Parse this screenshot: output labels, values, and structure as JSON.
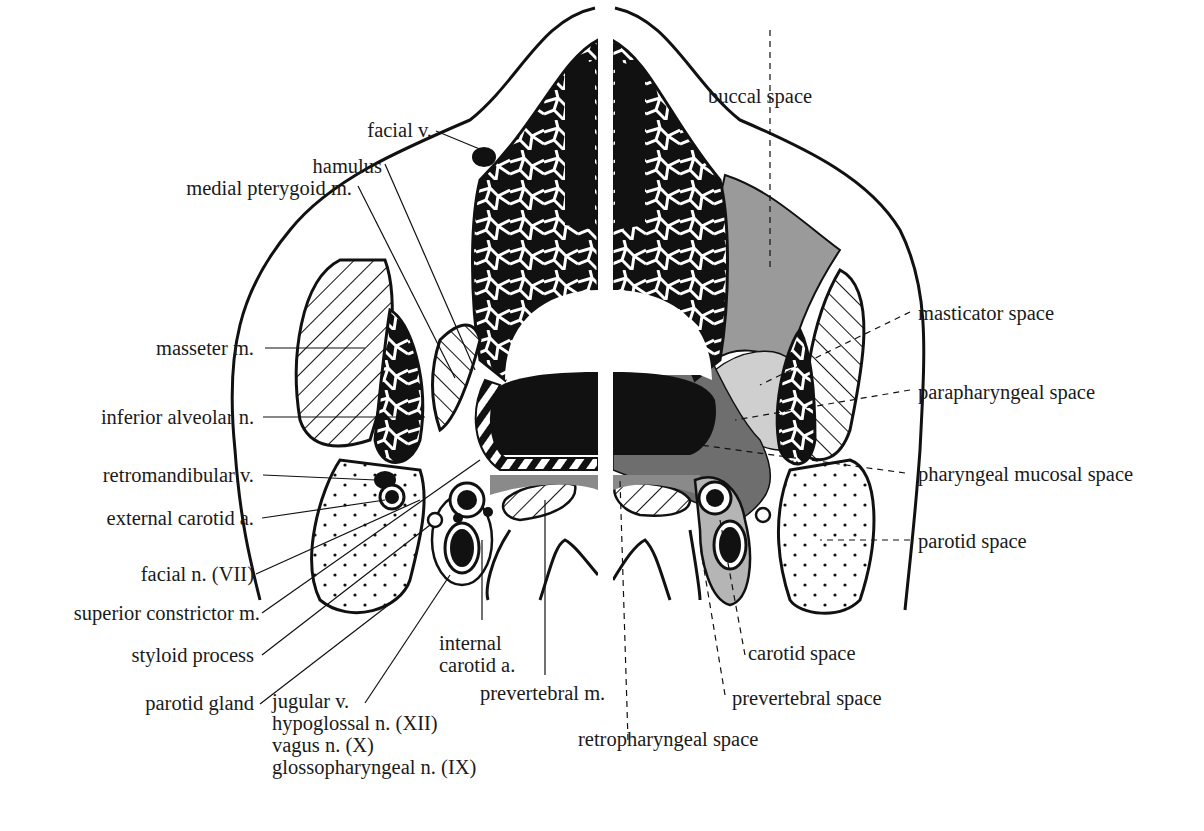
{
  "figure": {
    "type": "anatomical cross-section diagram (axial, suprahyoid neck)",
    "left_half_labels": [
      {
        "id": "facial-v",
        "text": "facial v."
      },
      {
        "id": "hamulus",
        "text": "hamulus"
      },
      {
        "id": "medial-pterygoid",
        "text": "medial pterygoid m."
      },
      {
        "id": "masseter",
        "text": "masseter m."
      },
      {
        "id": "inferior-alveolar",
        "text": "inferior alveolar n."
      },
      {
        "id": "retromandibular",
        "text": "retromandibular v."
      },
      {
        "id": "external-carotid",
        "text": "external carotid a."
      },
      {
        "id": "facial-n",
        "text": "facial n. (VII)"
      },
      {
        "id": "superior-constrictor",
        "text": "superior constrictor m."
      },
      {
        "id": "styloid",
        "text": "styloid process"
      },
      {
        "id": "parotid-gland",
        "text": "parotid gland"
      }
    ],
    "bottom_labels": {
      "internal_carotid": [
        "internal",
        "carotid a."
      ],
      "nerve_group": [
        "jugular v.",
        "hypoglossal n. (XII)",
        "vagus n. (X)",
        "glossopharyngeal  n. (IX)"
      ],
      "prevertebral_m": "prevertebral m.",
      "retropharyngeal_space": "retropharyngeal space",
      "prevertebral_space": "prevertebral space",
      "carotid_space": "carotid space"
    },
    "right_half_labels": [
      {
        "id": "buccal-space",
        "text": "buccal space"
      },
      {
        "id": "masticator-space",
        "text": "masticator space"
      },
      {
        "id": "parapharyngeal-space",
        "text": "parapharyngeal space"
      },
      {
        "id": "pharyngeal-mucosal-space",
        "text": "pharyngeal mucosal space"
      },
      {
        "id": "parotid-space",
        "text": "parotid space"
      }
    ],
    "colors": {
      "ink": "#111111",
      "buccal_masticator_fill": "#9a9a9a",
      "parapharyngeal_fill": "#cfcfcf",
      "mucosal_fill": "#6e6e6e",
      "carotid_fill": "#b5b5b5",
      "parotid_fill": "#ffffff"
    }
  }
}
